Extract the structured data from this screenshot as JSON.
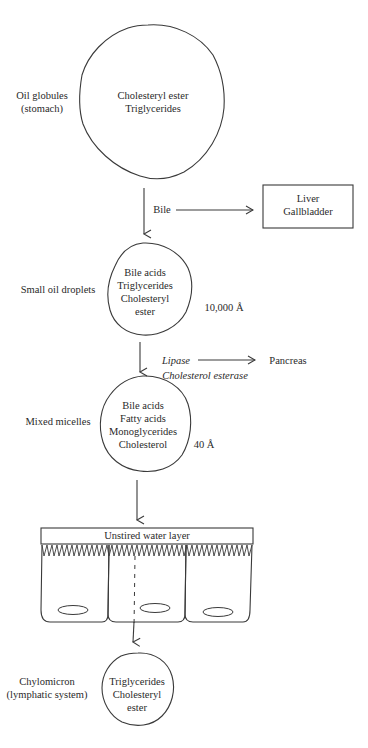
{
  "diagram": {
    "stages": [
      {
        "id": "oil-globules",
        "label_line1": "Oil globules",
        "label_line2": "(stomach)",
        "contents": [
          "Cholesteryl ester",
          "Triglycerides"
        ]
      },
      {
        "id": "small-oil-droplets",
        "label": "Small oil droplets",
        "contents": [
          "Bile acids",
          "Triglycerides",
          "Cholesteryl",
          "ester"
        ],
        "size": "10,000 Å"
      },
      {
        "id": "mixed-micelles",
        "label": "Mixed micelles",
        "contents": [
          "Bile acids",
          "Fatty acids",
          "Monoglycerides",
          "Cholesterol"
        ],
        "size": "40 Å"
      },
      {
        "id": "chylomicron",
        "label_line1": "Chylomicron",
        "label_line2": "(lymphatic system)",
        "contents": [
          "Triglycerides",
          "Cholesteryl",
          "ester"
        ]
      }
    ],
    "inputs": {
      "bile": {
        "label": "Bile",
        "source_line1": "Liver",
        "source_line2": "Gallbladder"
      },
      "enzymes": {
        "enzyme1": "Lipase",
        "enzyme2": "Cholesterol esterase",
        "source": "Pancreas"
      }
    },
    "intestine": {
      "layer_label": "Unstired water layer",
      "cell_count": 3
    },
    "colors": {
      "line": "#3a3a3a",
      "text": "#2a2a2a",
      "background": "#ffffff"
    }
  }
}
